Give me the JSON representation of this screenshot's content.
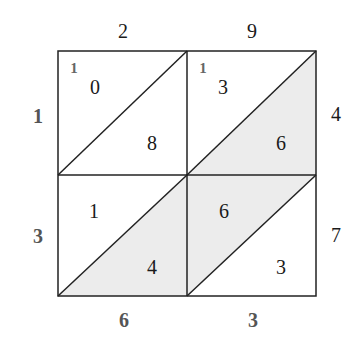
{
  "colors": {
    "shade": "#ececec",
    "line": "#222222",
    "background": "#ffffff"
  },
  "top_factor": [
    "2",
    "9"
  ],
  "right_factor": [
    "4",
    "7"
  ],
  "left_result": [
    "1",
    "3"
  ],
  "bottom_result": [
    "6",
    "3"
  ],
  "cells": [
    {
      "row": 0,
      "col": 0,
      "tens": "0",
      "ones": "8",
      "carry": "1",
      "shade": "none"
    },
    {
      "row": 0,
      "col": 1,
      "tens": "3",
      "ones": "6",
      "carry": "1",
      "shade": "lower"
    },
    {
      "row": 1,
      "col": 0,
      "tens": "1",
      "ones": "4",
      "carry": "",
      "shade": "lower"
    },
    {
      "row": 1,
      "col": 1,
      "tens": "6",
      "ones": "3",
      "carry": "",
      "shade": "upper"
    }
  ]
}
